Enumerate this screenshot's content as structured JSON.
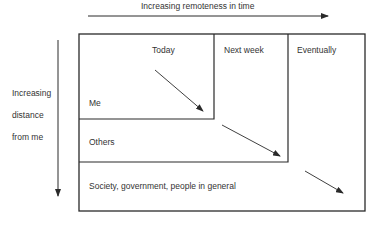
{
  "diagram": {
    "time_axis": {
      "label": "Increasing remoteness in time"
    },
    "distance_axis": {
      "label_lines": [
        "Increasing",
        "distance",
        "from me"
      ]
    },
    "columns": [
      "Today",
      "Next week",
      "Eventually"
    ],
    "rows": [
      "Me",
      "Others",
      "Society, government, people in general"
    ],
    "colors": {
      "line": "#2a2a2a",
      "background": "#ffffff"
    }
  }
}
